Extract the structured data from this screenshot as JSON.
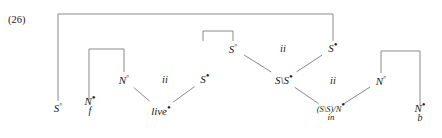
{
  "figure": {
    "number": "(26)",
    "type": "proof-net-derivation"
  },
  "nodes": [
    {
      "id": "s-open-root",
      "category": "S",
      "polarity": "open",
      "polarity_glyph": "◦",
      "label": "S◦",
      "word": "",
      "x": 58,
      "y": 107
    },
    {
      "id": "n-filled-f",
      "category": "N",
      "polarity": "filled",
      "polarity_glyph": "•",
      "label": "N•",
      "word": "f",
      "x": 90,
      "y": 106
    },
    {
      "id": "n-open-left",
      "category": "N",
      "polarity": "open",
      "polarity_glyph": "◦",
      "label": "N◦",
      "word": "",
      "x": 124,
      "y": 79
    },
    {
      "id": "s-filled-left",
      "category": "S",
      "polarity": "filled",
      "polarity_glyph": "•",
      "label": "S•",
      "word": "",
      "x": 205,
      "y": 79
    },
    {
      "id": "live",
      "category": "",
      "polarity": "filled",
      "polarity_glyph": "•",
      "label": "live•",
      "word": "live",
      "x": 161,
      "y": 111
    },
    {
      "id": "s-open-mid",
      "category": "S",
      "polarity": "open",
      "polarity_glyph": "◦",
      "label": "S◦",
      "word": "",
      "x": 233,
      "y": 48
    },
    {
      "id": "s-filled-right",
      "category": "S",
      "polarity": "filled",
      "polarity_glyph": "•",
      "label": "S•",
      "word": "",
      "x": 333,
      "y": 48
    },
    {
      "id": "s-under-s-filled",
      "category": "S\\S",
      "polarity": "filled",
      "polarity_glyph": "•",
      "label": "S\\S•",
      "word": "",
      "x": 284,
      "y": 80
    },
    {
      "id": "n-open-right",
      "category": "N",
      "polarity": "open",
      "polarity_glyph": "◦",
      "label": "N◦",
      "word": "",
      "x": 381,
      "y": 80
    },
    {
      "id": "in",
      "category": "(S\\S)/N",
      "polarity": "filled",
      "polarity_glyph": "•",
      "label": "(S\\S)/N•",
      "word": "in",
      "x": 331,
      "y": 112
    },
    {
      "id": "n-filled-b",
      "category": "N",
      "polarity": "filled",
      "polarity_glyph": "•",
      "label": "N•",
      "word": "b",
      "x": 420,
      "y": 113
    }
  ],
  "rule_labels": [
    {
      "id": "ii-left",
      "text": "ii",
      "x": 165,
      "y": 79
    },
    {
      "id": "ii-mid",
      "text": "ii",
      "x": 283,
      "y": 48
    },
    {
      "id": "ii-right",
      "text": "ii",
      "x": 333,
      "y": 80
    }
  ],
  "axiom_links": [
    {
      "id": "link-outer",
      "from": "s-open-root",
      "to": "s-filled-right",
      "shape": "bracket",
      "x1": 58,
      "x2": 333,
      "top": 14,
      "y1": 101,
      "y2": 41
    },
    {
      "id": "link-s-mid",
      "from": "s-open-mid",
      "to": "s-under-s-filled",
      "shape": "bracket",
      "x1": 233,
      "x2": 203,
      "top": 31,
      "y1": 41,
      "y2": 41
    },
    {
      "id": "link-n-left",
      "from": "n-filled-f",
      "to": "n-open-left",
      "shape": "bracket",
      "x1": 89,
      "x2": 124,
      "top": 49,
      "y1": 100,
      "y2": 72
    },
    {
      "id": "link-n-right",
      "from": "n-open-right",
      "to": "n-filled-b",
      "shape": "bracket",
      "x1": 381,
      "x2": 420,
      "top": 51,
      "y1": 73,
      "y2": 106
    }
  ],
  "derivation_edges": [
    {
      "id": "edge-nopen-live",
      "from": "n-open-left",
      "to": "live"
    },
    {
      "id": "edge-sfill-live",
      "from": "s-filled-left",
      "to": "live"
    },
    {
      "id": "edge-sopen-ss",
      "from": "s-open-mid",
      "to": "s-under-s-filled"
    },
    {
      "id": "edge-sfill-ss",
      "from": "s-filled-right",
      "to": "s-under-s-filled"
    },
    {
      "id": "edge-ss-in",
      "from": "s-under-s-filled",
      "to": "in"
    },
    {
      "id": "edge-nopen-in",
      "from": "n-open-right",
      "to": "in"
    }
  ],
  "style": {
    "line_color": "#8a8a8a",
    "text_color": "#1a1a1a",
    "background": "#ffffff"
  }
}
